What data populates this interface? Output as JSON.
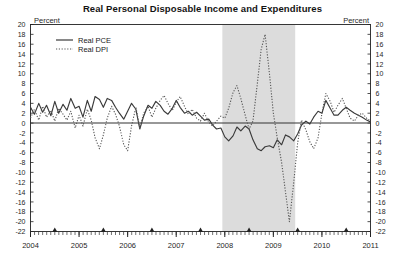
{
  "chart_data": {
    "type": "line",
    "title": "Real Personal Disposable Income and Expenditures",
    "xlabel": "",
    "ylabel": "Percent",
    "ylabel_right": "Percent",
    "ylim": [
      -22,
      20
    ],
    "xlim": [
      2004,
      2011
    ],
    "ytick_step": 2,
    "grid": false,
    "legend_position": "top-left",
    "yticks": [
      20,
      18,
      16,
      14,
      12,
      10,
      8,
      6,
      4,
      2,
      0,
      -2,
      -4,
      -6,
      -8,
      -10,
      -12,
      -14,
      -16,
      -18,
      -20,
      -22
    ],
    "ytick_labels": [
      "20",
      "18",
      "16",
      "14",
      "12",
      "10",
      "8",
      "6",
      "4",
      "2",
      "0",
      "-2",
      "-4",
      "-6",
      "-8",
      "-10",
      "-12",
      "-14",
      "-16",
      "-18",
      "-20",
      "-22"
    ],
    "xticks": [
      2004,
      2005,
      2006,
      2007,
      2008,
      2009,
      2010,
      2011
    ],
    "xtick_labels": [
      "2004",
      "2005",
      "2006",
      "2007",
      "2008",
      "2009",
      "2010",
      "2011"
    ],
    "minor_tick_markers": [
      2004.5,
      2005.5,
      2006.5,
      2007.5,
      2008.5,
      2009.5,
      2010.5
    ],
    "shaded_regions": [
      {
        "label": "recession",
        "start": 2007.95,
        "end": 2009.45,
        "color": "#dcdcdc"
      }
    ],
    "zero_line": 0,
    "series": [
      {
        "name": "Real PCE",
        "style": "solid",
        "color": "#3a3a3a",
        "x": [
          2004.0,
          2004.08,
          2004.17,
          2004.25,
          2004.33,
          2004.42,
          2004.5,
          2004.58,
          2004.67,
          2004.75,
          2004.83,
          2004.92,
          2005.0,
          2005.08,
          2005.17,
          2005.25,
          2005.33,
          2005.42,
          2005.5,
          2005.58,
          2005.67,
          2005.75,
          2005.83,
          2005.92,
          2006.0,
          2006.08,
          2006.17,
          2006.25,
          2006.33,
          2006.42,
          2006.5,
          2006.58,
          2006.67,
          2006.75,
          2006.83,
          2006.92,
          2007.0,
          2007.08,
          2007.17,
          2007.25,
          2007.33,
          2007.42,
          2007.5,
          2007.58,
          2007.67,
          2007.75,
          2007.83,
          2007.92,
          2008.0,
          2008.08,
          2008.17,
          2008.25,
          2008.33,
          2008.42,
          2008.5,
          2008.58,
          2008.67,
          2008.75,
          2008.83,
          2008.92,
          2009.0,
          2009.08,
          2009.17,
          2009.25,
          2009.33,
          2009.42,
          2009.5,
          2009.58,
          2009.67,
          2009.75,
          2009.83,
          2009.92,
          2010.0,
          2010.08,
          2010.17,
          2010.25,
          2010.33,
          2010.42,
          2010.5,
          2010.58,
          2010.67,
          2010.75,
          2010.83,
          2010.92,
          2011.0
        ],
        "values": [
          3.2,
          1.8,
          4.0,
          2.2,
          3.6,
          1.5,
          4.4,
          2.0,
          3.8,
          2.6,
          5.0,
          3.0,
          3.4,
          1.2,
          4.6,
          2.4,
          5.4,
          4.8,
          3.2,
          5.0,
          4.6,
          3.2,
          2.0,
          0.8,
          2.4,
          4.0,
          2.8,
          -1.2,
          1.4,
          3.6,
          3.0,
          4.4,
          3.6,
          2.4,
          1.8,
          3.0,
          4.6,
          3.2,
          2.0,
          2.4,
          1.6,
          2.2,
          1.4,
          0.6,
          0.8,
          -0.4,
          -1.2,
          -1.0,
          -2.8,
          -3.6,
          -2.6,
          -0.8,
          -1.6,
          -0.6,
          -1.2,
          -3.4,
          -5.2,
          -5.6,
          -4.8,
          -4.6,
          -5.0,
          -3.4,
          -4.4,
          -2.4,
          -2.8,
          -3.6,
          -2.2,
          -0.4,
          0.4,
          -0.2,
          1.2,
          2.4,
          2.0,
          4.6,
          3.0,
          1.6,
          1.6,
          2.6,
          3.2,
          2.6,
          2.0,
          1.6,
          1.2,
          0.6,
          0.2
        ]
      },
      {
        "name": "Real DPI",
        "style": "dotted",
        "color": "#555555",
        "x": [
          2004.0,
          2004.08,
          2004.17,
          2004.25,
          2004.33,
          2004.42,
          2004.5,
          2004.58,
          2004.67,
          2004.75,
          2004.83,
          2004.92,
          2005.0,
          2005.08,
          2005.17,
          2005.25,
          2005.33,
          2005.42,
          2005.5,
          2005.58,
          2005.67,
          2005.75,
          2005.83,
          2005.92,
          2006.0,
          2006.08,
          2006.17,
          2006.25,
          2006.33,
          2006.42,
          2006.5,
          2006.58,
          2006.67,
          2006.75,
          2006.83,
          2006.92,
          2007.0,
          2007.08,
          2007.17,
          2007.25,
          2007.33,
          2007.42,
          2007.5,
          2007.58,
          2007.67,
          2007.75,
          2007.83,
          2007.92,
          2008.0,
          2008.08,
          2008.17,
          2008.25,
          2008.33,
          2008.42,
          2008.5,
          2008.58,
          2008.67,
          2008.75,
          2008.83,
          2008.92,
          2009.0,
          2009.08,
          2009.17,
          2009.25,
          2009.33,
          2009.42,
          2009.5,
          2009.58,
          2009.67,
          2009.75,
          2009.83,
          2009.92,
          2010.0,
          2010.08,
          2010.17,
          2010.25,
          2010.33,
          2010.42,
          2010.5,
          2010.58,
          2010.67,
          2010.75,
          2010.83,
          2010.92,
          2011.0
        ],
        "values": [
          1.0,
          2.8,
          0.6,
          3.4,
          1.2,
          2.6,
          0.4,
          3.0,
          1.8,
          0.6,
          2.4,
          -1.0,
          1.6,
          -0.6,
          2.8,
          0.6,
          -3.0,
          -5.2,
          -2.4,
          1.0,
          3.4,
          1.8,
          -0.6,
          -4.4,
          -5.6,
          -0.6,
          3.2,
          -1.0,
          2.0,
          3.4,
          1.2,
          3.0,
          4.6,
          5.6,
          4.0,
          2.6,
          4.2,
          5.4,
          3.4,
          1.8,
          2.8,
          1.0,
          0.4,
          2.0,
          0.2,
          -0.6,
          0.4,
          1.4,
          1.0,
          3.0,
          6.2,
          7.6,
          5.0,
          1.6,
          -1.2,
          0.4,
          8.0,
          15.0,
          18.0,
          10.0,
          2.0,
          -3.0,
          -8.0,
          -14.0,
          -20.0,
          -12.0,
          -4.0,
          0.6,
          -1.4,
          -3.8,
          -5.2,
          -3.0,
          2.0,
          6.0,
          4.4,
          2.2,
          3.6,
          5.0,
          3.0,
          1.0,
          0.4,
          1.6,
          2.0,
          1.0,
          0.4
        ]
      }
    ]
  },
  "legend": {
    "items": [
      {
        "label": "Real PCE",
        "style": "solid"
      },
      {
        "label": "Real DPI",
        "style": "dotted"
      }
    ]
  }
}
